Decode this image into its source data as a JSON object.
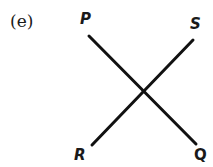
{
  "figure": {
    "label": "(e)",
    "points": {
      "P": "P",
      "Q": "Q",
      "R": "R",
      "S": "S"
    },
    "lines": [
      {
        "name": "PQ",
        "from": "P",
        "to": "Q"
      },
      {
        "name": "RS",
        "from": "R",
        "to": "S"
      }
    ],
    "line_color": "#111111"
  }
}
